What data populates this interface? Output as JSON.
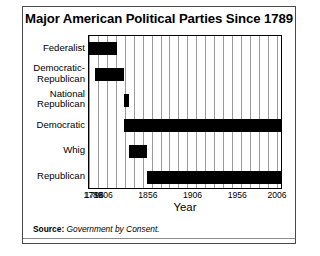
{
  "figure": {
    "title": "Major American Political Parties Since 1789",
    "source_label": "Source:",
    "source_value": "Government by Consent."
  },
  "chart_data": {
    "type": "bar",
    "orientation": "horizontal",
    "title": "Major American Political Parties Since 1789",
    "xlabel": "Year",
    "ylabel": "",
    "xlim": [
      1789,
      2006
    ],
    "grid": true,
    "grid_interval": 10,
    "legend": "none",
    "xticks": [
      1789,
      1796,
      1806,
      1856,
      1906,
      1956,
      2006
    ],
    "xticklabels": [
      "1789",
      "1796",
      "1806",
      "1856",
      "1906",
      "1956",
      "2006"
    ],
    "categories": [
      "Federalist",
      "Democratic-\nRepublican",
      "National\nRepublican",
      "Democratic",
      "Whig",
      "Republican"
    ],
    "bars": [
      {
        "label": "Federalist",
        "start": 1789,
        "end": 1820,
        "color": "#000000"
      },
      {
        "label": "Democratic-Republican",
        "start": 1796,
        "end": 1828,
        "color": "#000000"
      },
      {
        "label": "National Republican",
        "start": 1828,
        "end": 1834,
        "color": "#000000"
      },
      {
        "label": "Democratic",
        "start": 1828,
        "end": 2006,
        "color": "#000000"
      },
      {
        "label": "Whig",
        "start": 1834,
        "end": 1854,
        "color": "#000000"
      },
      {
        "label": "Republican",
        "start": 1854,
        "end": 2006,
        "color": "#000000"
      }
    ]
  }
}
